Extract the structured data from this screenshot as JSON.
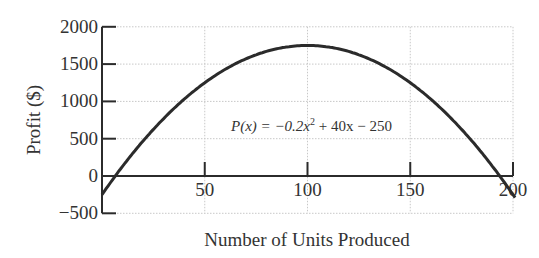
{
  "chart_data": {
    "type": "line",
    "title": "",
    "xlabel": "Number of Units Produced",
    "ylabel": "Profit ($)",
    "xlim": [
      0,
      200
    ],
    "ylim": [
      -500,
      2000
    ],
    "x_ticks": [
      50,
      100,
      150,
      200
    ],
    "x_tick_labels": [
      "50",
      "100",
      "150",
      "200"
    ],
    "y_ticks": [
      -500,
      0,
      500,
      1000,
      1500,
      2000
    ],
    "y_tick_labels": [
      "−500",
      "0",
      "500",
      "1000",
      "1500",
      "2000"
    ],
    "grid": true,
    "legend": null,
    "annotation": {
      "text_prefix": "P(x) = −0.2x",
      "superscript": "2",
      "text_suffix": " + 40x − 250",
      "x": 60,
      "y": 300
    },
    "series": [
      {
        "name": "P(x) = -0.2x^2 + 40x - 250",
        "function": {
          "a": -0.2,
          "b": 40,
          "c": -250
        },
        "x": [
          0,
          10,
          20,
          30,
          40,
          50,
          60,
          70,
          80,
          90,
          100,
          110,
          120,
          130,
          140,
          150,
          160,
          170,
          180,
          190,
          200
        ],
        "values": [
          -250,
          130,
          470,
          770,
          1030,
          1250,
          1430,
          1570,
          1670,
          1730,
          1750,
          1730,
          1670,
          1570,
          1430,
          1250,
          1030,
          770,
          470,
          130,
          -250
        ]
      }
    ],
    "colors": {
      "line": "#2b2b2b",
      "axis": "#2b2b2b",
      "grid": "#c8c8c8"
    }
  }
}
